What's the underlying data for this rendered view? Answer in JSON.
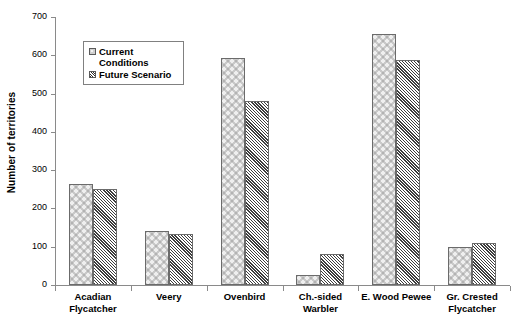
{
  "chart_data": {
    "type": "bar",
    "title": "",
    "xlabel": "",
    "ylabel": "Number of territories",
    "ylim": [
      0,
      700
    ],
    "ytick_values": [
      0,
      100,
      200,
      300,
      400,
      500,
      600,
      700
    ],
    "ytick_labels": [
      "0",
      "100",
      "200",
      "300",
      "400",
      "500",
      "600",
      "700"
    ],
    "grid": false,
    "legend_position": "upper-left-inside",
    "categories": [
      "Acadian\nFlycatcher",
      "Veery",
      "Ovenbird",
      "Ch.-sided\nWarbler",
      "E. Wood Pewee",
      "Gr. Crested\nFlycatcher"
    ],
    "series": [
      {
        "name": "Current\nConditions",
        "pattern": "dotted-light",
        "values": [
          265,
          140,
          593,
          25,
          655,
          100
        ]
      },
      {
        "name": "Future Scenario",
        "pattern": "dense-diagonal-hatch",
        "values": [
          252,
          132,
          480,
          82,
          588,
          110
        ]
      }
    ]
  },
  "legend": {
    "entries": [
      {
        "label": "Current\nConditions",
        "swatch": "current"
      },
      {
        "label": "Future Scenario",
        "swatch": "future"
      }
    ]
  },
  "colors": {
    "current_fill": "#cfcfcf",
    "future_fill": "#6f6f6f",
    "axis": "#8a8a8a",
    "bar_border": "#6b6b6b",
    "background": "#ffffff"
  }
}
